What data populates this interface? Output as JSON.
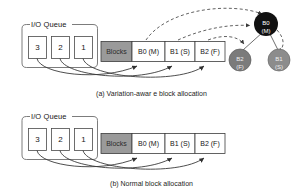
{
  "figure": {
    "panels": [
      {
        "id": "panel-a",
        "caption": "(a) Variation-awar  e block allocation",
        "queue": {
          "title": "I/O Queue",
          "items": [
            "3",
            "2",
            "1"
          ]
        },
        "block_row": {
          "header": "Blocks",
          "cells": [
            "B0 (M)",
            "B1 (S)",
            "B2 (F)"
          ]
        },
        "tree": {
          "root": {
            "line1": "B0",
            "line2": "(M)",
            "fill": "#111111"
          },
          "children": [
            {
              "line1": "B2",
              "line2": "(F)",
              "fill": "#7b7b7b"
            },
            {
              "line1": "B1",
              "line2": "(S)",
              "fill": "#8c8c8c"
            }
          ]
        }
      },
      {
        "id": "panel-b",
        "caption": "(b) Normal block allocation",
        "queue": {
          "title": "I/O Queue",
          "items": [
            "3",
            "2",
            "1"
          ]
        },
        "block_row": {
          "header": "Blocks",
          "cells": [
            "B0 (M)",
            "B1 (S)",
            "B2 (F)"
          ]
        }
      }
    ]
  },
  "colors": {
    "stroke": "#3a3a3a",
    "blocks_fill": "#9a9a9a",
    "cell_fill": "#ffffff",
    "dashed": "#404040",
    "page_bg": "#ffffff"
  }
}
